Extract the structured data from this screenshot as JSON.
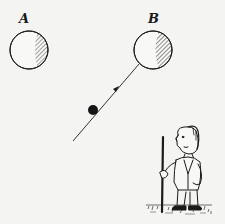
{
  "figure": {
    "labels": {
      "a": "A",
      "b": "B"
    },
    "elements": [
      {
        "name": "ball-a",
        "label": "A",
        "shape": "circle",
        "shading": "right-side hatched"
      },
      {
        "name": "ball-b",
        "label": "B",
        "shape": "circle",
        "shading": "right-side hatched"
      },
      {
        "name": "cue-ball",
        "shape": "filled circle"
      },
      {
        "name": "trajectory-line",
        "direction": "from cue ball toward B",
        "has_arrow": true
      },
      {
        "name": "cartoon-man",
        "holding": "cue stick"
      }
    ],
    "colors": {
      "background": "#f4f4f2",
      "ink": "#1a1a1a"
    }
  }
}
